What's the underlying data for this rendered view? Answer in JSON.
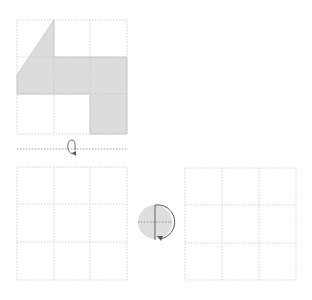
{
  "colors": {
    "grid_line": "#c8c8c8",
    "shape_fill": "#dcdcdc",
    "shape_stroke": "#c4c4c4",
    "fold_line": "#888888",
    "arrow": "#555555",
    "circle_fill": "#dedede"
  },
  "diagram": {
    "top_grid": {
      "x": 17,
      "y": 20,
      "size": 110,
      "rows": 3,
      "cols": 3
    },
    "shape_points": "17,75 54,20 54,57 127,57 127,134 90,134 90,94 17,94",
    "fold_line": {
      "y": 149,
      "x1": 17,
      "x2": 127
    },
    "bottom_left_grid": {
      "x": 17,
      "y": 167,
      "size": 110,
      "rows": 3,
      "cols": 3
    },
    "bottom_right_grid": {
      "x": 185,
      "y": 168,
      "size": 111,
      "rows": 3,
      "cols": 3
    },
    "rotation_symbol": {
      "cx": 155,
      "cy": 222,
      "r": 17
    },
    "icons": [
      "flip-arrow-icon",
      "half-turn-rotation-icon"
    ]
  }
}
